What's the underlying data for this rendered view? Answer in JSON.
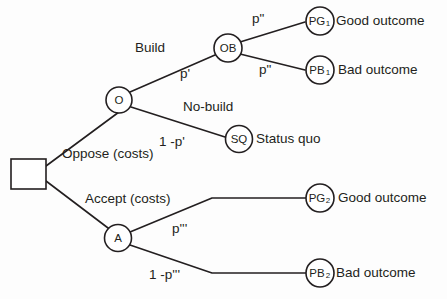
{
  "diagram": {
    "type": "decision-tree",
    "colors": {
      "stroke": "#231f20",
      "background": "#fdfdfd",
      "node_fill": "#ffffff"
    },
    "root": {
      "shape": "square",
      "name": "decision-node"
    },
    "nodes": [
      {
        "id": "O",
        "label": "O",
        "sub": "",
        "shape": "circle"
      },
      {
        "id": "OB",
        "label": "OB",
        "sub": "",
        "shape": "circle"
      },
      {
        "id": "SQ",
        "label": "SQ",
        "sub": "",
        "shape": "circle"
      },
      {
        "id": "A",
        "label": "A",
        "sub": "",
        "shape": "circle"
      },
      {
        "id": "PG1",
        "label": "PG",
        "sub": "1",
        "shape": "circle"
      },
      {
        "id": "PB1",
        "label": "PB",
        "sub": "1",
        "shape": "circle"
      },
      {
        "id": "PG2",
        "label": "PG",
        "sub": "2",
        "shape": "circle"
      },
      {
        "id": "PB2",
        "label": "PB",
        "sub": "2",
        "shape": "circle"
      }
    ],
    "branch_labels": {
      "oppose": "Oppose (costs)",
      "accept": "Accept (costs)",
      "build": "Build",
      "no_build": "No-build"
    },
    "probability_labels": {
      "p_prime": "p'",
      "one_minus_p_prime": "1 -p'",
      "p_double_prime_good": "p\"",
      "p_double_prime_bad": "p\"",
      "p_triple_prime": "p'''",
      "one_minus_p_triple_prime": "1 -p'''"
    },
    "outcomes": {
      "pg1": "Good outcome",
      "pb1": "Bad outcome",
      "sq": "Status quo",
      "pg2": "Good outcome",
      "pb2": "Bad outcome"
    }
  }
}
